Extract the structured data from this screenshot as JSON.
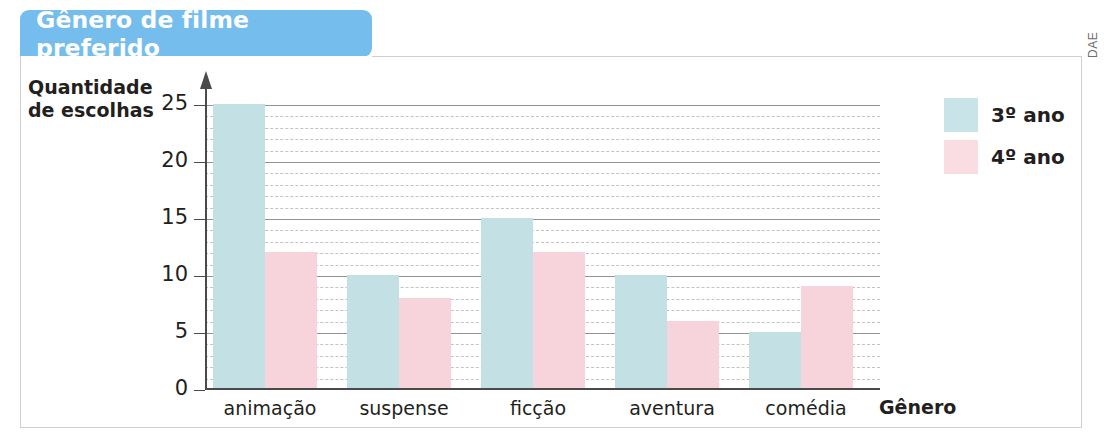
{
  "title": "Gênero de filme preferido",
  "credit": "DAE",
  "colors": {
    "banner": "#74bdec",
    "series_3ano": "#c3e0e4",
    "series_4ano": "#f7d3dc",
    "axis": "#4a4a4a",
    "grid_major": "#6f6f6f",
    "grid_minor": "#b9b9b9"
  },
  "axis_titles": {
    "y_line1": "Quantidade",
    "y_line2": "de escolhas",
    "x": "Gênero"
  },
  "legend": {
    "position": "top-right",
    "items": [
      {
        "label": "3º ano",
        "color": "#c9e4e8"
      },
      {
        "label": "4º ano",
        "color": "#f9dde3"
      }
    ]
  },
  "chart_data": {
    "type": "bar",
    "title": "Gênero de filme preferido",
    "xlabel": "Gênero",
    "ylabel": "Quantidade de escolhas",
    "categories": [
      "animação",
      "suspense",
      "ficção",
      "aventura",
      "comédia"
    ],
    "series": [
      {
        "name": "3º ano",
        "color": "#c3e0e4",
        "values": [
          25,
          10,
          15,
          10,
          5
        ]
      },
      {
        "name": "4º ano",
        "color": "#f7d3dc",
        "values": [
          12,
          8,
          12,
          6,
          9
        ]
      }
    ],
    "ylim": [
      0,
      25
    ],
    "yticks": [
      0,
      5,
      10,
      15,
      20,
      25
    ],
    "ytick_labels": [
      "0",
      "5",
      "10",
      "15",
      "20",
      "25"
    ],
    "minor_tick_step": 1,
    "grid": "major solid + minor dashed horizontal",
    "legend_position": "top-right"
  }
}
